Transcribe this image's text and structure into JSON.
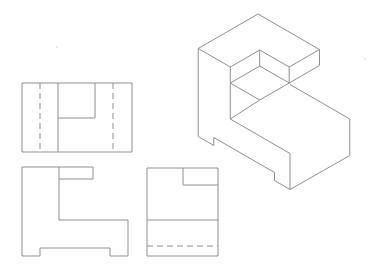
{
  "figure": {
    "type": "engineering-drawing",
    "canvas": {
      "width": 372,
      "height": 269
    },
    "background_color": "#ffffff",
    "stroke_color": "#8e8e8e",
    "stroke_width": 1,
    "dash_pattern": "6,4",
    "views": [
      {
        "name": "top-view",
        "role": "orthographic top view with hidden lines",
        "polylines": [
          [
            [
              22,
              83
            ],
            [
              132,
              83
            ],
            [
              132,
              152
            ],
            [
              22,
              152
            ],
            [
              22,
              83
            ]
          ]
        ],
        "lines": [
          [
            58,
            83,
            58,
            152
          ],
          [
            95,
            83,
            95,
            118
          ],
          [
            58,
            118,
            95,
            118
          ]
        ],
        "dashed": [
          [
            40,
            83,
            40,
            152
          ],
          [
            113,
            83,
            113,
            152
          ]
        ]
      },
      {
        "name": "front-view",
        "role": "orthographic front view, L-shaped outline with bottom feet notch",
        "polylines": [
          [
            [
              22,
              167
            ],
            [
              93,
              167
            ],
            [
              93,
              179
            ],
            [
              59,
              179
            ],
            [
              59,
              220
            ],
            [
              128,
              220
            ],
            [
              128,
              256
            ],
            [
              110,
              256
            ],
            [
              110,
              248
            ],
            [
              40,
              248
            ],
            [
              40,
              256
            ],
            [
              22,
              256
            ],
            [
              22,
              167
            ]
          ]
        ],
        "lines": [
          [
            59,
            167,
            59,
            179
          ]
        ],
        "dashed": []
      },
      {
        "name": "side-view",
        "role": "orthographic right side view with hidden line",
        "polylines": [
          [
            [
              147,
              168
            ],
            [
              218,
              168
            ],
            [
              218,
              256
            ],
            [
              147,
              256
            ],
            [
              147,
              168
            ]
          ]
        ],
        "lines": [
          [
            183,
            168,
            183,
            185
          ],
          [
            183,
            185,
            218,
            185
          ],
          [
            147,
            220,
            218,
            220
          ]
        ],
        "dashed": [
          [
            147,
            246,
            218,
            246
          ]
        ]
      },
      {
        "name": "isometric-view",
        "role": "isometric pictorial of the object",
        "polylines": [],
        "lines": [
          [
            258,
            14,
            319.5,
            49.5
          ],
          [
            319.5,
            49.5,
            289.2,
            67
          ],
          [
            289.2,
            67,
            259.7,
            50
          ],
          [
            259.7,
            50,
            230.3,
            67
          ],
          [
            230.3,
            67,
            198.2,
            48.5
          ],
          [
            198.2,
            48.5,
            258,
            14
          ],
          [
            319.5,
            49.5,
            319.5,
            65.5
          ],
          [
            319.5,
            65.5,
            289.2,
            83
          ],
          [
            289.2,
            67,
            289.2,
            83
          ],
          [
            259.7,
            50,
            259.7,
            66
          ],
          [
            259.7,
            66,
            289.2,
            83
          ],
          [
            259.7,
            66,
            230.3,
            83
          ],
          [
            230.3,
            83,
            259.7,
            100
          ],
          [
            289.2,
            83,
            259.7,
            100
          ],
          [
            259.7,
            100,
            230.3,
            119
          ],
          [
            230.3,
            67,
            230.3,
            119
          ],
          [
            290,
            84.5,
            349.8,
            119
          ],
          [
            349.8,
            119,
            349.8,
            155.5
          ],
          [
            349.8,
            155.5,
            290,
            189.5
          ],
          [
            290,
            153.5,
            290,
            189.5
          ],
          [
            230.3,
            119,
            290,
            153.5
          ],
          [
            198.2,
            48.5,
            198.2,
            136.5
          ],
          [
            198.2,
            136.5,
            213.8,
            145.5
          ],
          [
            213.8,
            145.5,
            213.8,
            137.5
          ],
          [
            213.8,
            137.5,
            274.5,
            172.5
          ],
          [
            274.5,
            172.5,
            274.5,
            180.5
          ],
          [
            274.5,
            180.5,
            290,
            189.5
          ]
        ],
        "dashed": []
      }
    ],
    "specks": [
      {
        "x": 57,
        "y": 47,
        "size": 1.5,
        "color": "#c8c8c8"
      },
      {
        "x": 365,
        "y": 59,
        "size": 1.5,
        "color": "#d2d2d2"
      }
    ]
  }
}
